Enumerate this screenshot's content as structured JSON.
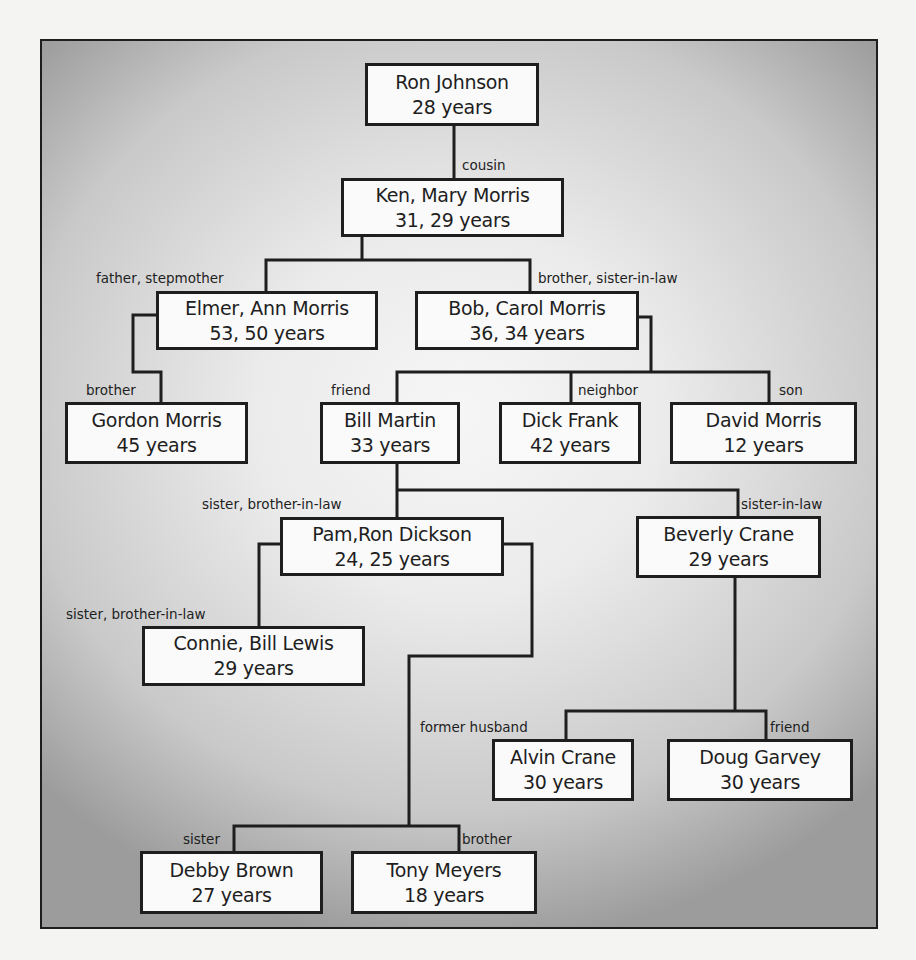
{
  "diagram": {
    "type": "relationship-tree",
    "nodes": [
      {
        "id": "ron-johnson",
        "name": "Ron Johnson",
        "age": "28 years"
      },
      {
        "id": "ken-mary-morris",
        "name": "Ken, Mary Morris",
        "age": "31, 29 years"
      },
      {
        "id": "elmer-ann-morris",
        "name": "Elmer, Ann Morris",
        "age": "53, 50 years"
      },
      {
        "id": "bob-carol-morris",
        "name": "Bob, Carol Morris",
        "age": "36, 34 years"
      },
      {
        "id": "gordon-morris",
        "name": "Gordon Morris",
        "age": "45 years"
      },
      {
        "id": "bill-martin",
        "name": "Bill Martin",
        "age": "33 years"
      },
      {
        "id": "dick-frank",
        "name": "Dick Frank",
        "age": "42 years"
      },
      {
        "id": "david-morris",
        "name": "David Morris",
        "age": "12 years"
      },
      {
        "id": "pam-ron-dickson",
        "name": "Pam,Ron Dickson",
        "age": "24, 25 years"
      },
      {
        "id": "beverly-crane",
        "name": "Beverly Crane",
        "age": "29 years"
      },
      {
        "id": "connie-bill-lewis",
        "name": "Connie, Bill Lewis",
        "age": "29 years"
      },
      {
        "id": "alvin-crane",
        "name": "Alvin Crane",
        "age": "30 years"
      },
      {
        "id": "doug-garvey",
        "name": "Doug Garvey",
        "age": "30 years"
      },
      {
        "id": "debby-brown",
        "name": "Debby Brown",
        "age": "27 years"
      },
      {
        "id": "tony-meyers",
        "name": "Tony Meyers",
        "age": "18 years"
      }
    ],
    "relations": [
      {
        "from": "ron-johnson",
        "to": "ken-mary-morris",
        "label": "cousin"
      },
      {
        "from": "ken-mary-morris",
        "to": "elmer-ann-morris",
        "label": "father, stepmother"
      },
      {
        "from": "ken-mary-morris",
        "to": "bob-carol-morris",
        "label": "brother, sister-in-law"
      },
      {
        "from": "elmer-ann-morris",
        "to": "gordon-morris",
        "label": "brother"
      },
      {
        "from": "bob-carol-morris",
        "to": "bill-martin",
        "label": "friend"
      },
      {
        "from": "bob-carol-morris",
        "to": "dick-frank",
        "label": "neighbor"
      },
      {
        "from": "bob-carol-morris",
        "to": "david-morris",
        "label": "son"
      },
      {
        "from": "bill-martin",
        "to": "pam-ron-dickson",
        "label": "sister, brother-in-law"
      },
      {
        "from": "bill-martin",
        "to": "beverly-crane",
        "label": "sister-in-law"
      },
      {
        "from": "pam-ron-dickson",
        "to": "connie-bill-lewis",
        "label": "sister, brother-in-law"
      },
      {
        "from": "beverly-crane",
        "to": "alvin-crane",
        "label": "former husband"
      },
      {
        "from": "beverly-crane",
        "to": "doug-garvey",
        "label": "friend"
      },
      {
        "from": "pam-ron-dickson",
        "to": "debby-brown",
        "label": "sister"
      },
      {
        "from": "pam-ron-dickson",
        "to": "tony-meyers",
        "label": "brother"
      }
    ]
  },
  "colors": {
    "line": "#1e1e1e",
    "box_fill": "#fafafa",
    "frame_center": "#f6f6f6",
    "frame_edge": "#9c9c9c",
    "page": "#f4f4f2"
  }
}
